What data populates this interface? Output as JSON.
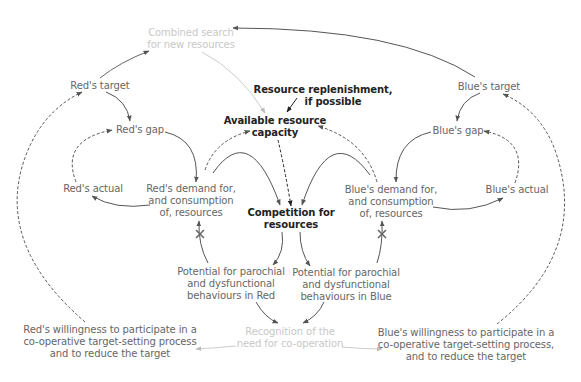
{
  "diagram": {
    "nodes": {
      "combined_search": {
        "lines": [
          "Combined search",
          "for new resources"
        ],
        "style": "faint"
      },
      "red_target": {
        "lines": [
          "Red's target"
        ],
        "style": "normal"
      },
      "blue_target": {
        "lines": [
          "Blue's target"
        ],
        "style": "normal"
      },
      "replenishment": {
        "lines": [
          "Resource replenishment,",
          "if possible"
        ],
        "style": "dark"
      },
      "available_capacity": {
        "lines": [
          "Available resource",
          "capacity"
        ],
        "style": "dark"
      },
      "red_gap": {
        "lines": [
          "Red's gap"
        ],
        "style": "normal"
      },
      "blue_gap": {
        "lines": [
          "Blue's gap"
        ],
        "style": "normal"
      },
      "red_actual": {
        "lines": [
          "Red's actual"
        ],
        "style": "normal"
      },
      "blue_actual": {
        "lines": [
          "Blue's actual"
        ],
        "style": "normal"
      },
      "red_demand": {
        "lines": [
          "Red's demand for,",
          "and consumption",
          "of, resources"
        ],
        "style": "normal"
      },
      "blue_demand": {
        "lines": [
          "Blue's demand for,",
          "and consumption",
          "of, resources"
        ],
        "style": "normal"
      },
      "competition": {
        "lines": [
          "Competition for",
          "resources"
        ],
        "style": "dark"
      },
      "red_parochial": {
        "lines": [
          "Potential for parochial",
          "and dysfunctional",
          "behaviours in Red"
        ],
        "style": "normal"
      },
      "blue_parochial": {
        "lines": [
          "Potential for parochial",
          "and dysfunctional",
          "behaviours in Blue"
        ],
        "style": "normal"
      },
      "recognition": {
        "lines": [
          "Recognition of the",
          "need for co-operation"
        ],
        "style": "faint"
      },
      "red_willingness": {
        "lines": [
          "Red's willingness to participate in a",
          "co-operative target-setting process",
          "and to reduce the target"
        ],
        "style": "normal"
      },
      "blue_willingness": {
        "lines": [
          "Blue's willingness to participate in a",
          "co-operative target-setting process,",
          "and to reduce the target"
        ],
        "style": "normal"
      }
    },
    "links": [
      {
        "from": "red_target",
        "to": "combined_search",
        "style": "solid"
      },
      {
        "from": "blue_target",
        "to": "combined_search",
        "style": "solid"
      },
      {
        "from": "combined_search",
        "to": "available_capacity",
        "style": "solid-faint"
      },
      {
        "from": "replenishment",
        "to": "available_capacity",
        "style": "solid-dark"
      },
      {
        "from": "red_target",
        "to": "red_gap",
        "style": "solid"
      },
      {
        "from": "blue_target",
        "to": "blue_gap",
        "style": "solid"
      },
      {
        "from": "red_gap",
        "to": "red_demand",
        "style": "solid"
      },
      {
        "from": "blue_gap",
        "to": "blue_demand",
        "style": "solid"
      },
      {
        "from": "red_demand",
        "to": "red_actual",
        "style": "solid"
      },
      {
        "from": "blue_demand",
        "to": "blue_actual",
        "style": "solid"
      },
      {
        "from": "red_actual",
        "to": "red_gap",
        "style": "dashed"
      },
      {
        "from": "blue_actual",
        "to": "blue_gap",
        "style": "dashed"
      },
      {
        "from": "red_demand",
        "to": "available_capacity",
        "style": "dashed"
      },
      {
        "from": "blue_demand",
        "to": "available_capacity",
        "style": "dashed"
      },
      {
        "from": "available_capacity",
        "to": "competition",
        "style": "dashed-dark"
      },
      {
        "from": "red_demand",
        "to": "competition",
        "style": "solid"
      },
      {
        "from": "blue_demand",
        "to": "competition",
        "style": "solid"
      },
      {
        "from": "competition",
        "to": "red_parochial",
        "style": "solid"
      },
      {
        "from": "competition",
        "to": "blue_parochial",
        "style": "solid"
      },
      {
        "from": "red_parochial",
        "to": "red_demand",
        "style": "solid",
        "delay": true
      },
      {
        "from": "blue_parochial",
        "to": "blue_demand",
        "style": "solid",
        "delay": true
      },
      {
        "from": "red_parochial",
        "to": "recognition",
        "style": "solid"
      },
      {
        "from": "blue_parochial",
        "to": "recognition",
        "style": "solid"
      },
      {
        "from": "recognition",
        "to": "red_willingness",
        "style": "solid-faint"
      },
      {
        "from": "recognition",
        "to": "blue_willingness",
        "style": "solid-faint"
      },
      {
        "from": "red_willingness",
        "to": "red_target",
        "style": "dashed"
      },
      {
        "from": "blue_willingness",
        "to": "blue_target",
        "style": "dashed"
      }
    ],
    "colors": {
      "normal_text": "#666666",
      "dark_text": "#222222",
      "faint_text": "#c8c8c8",
      "line": "#666666",
      "faint_line": "#cccccc"
    }
  }
}
